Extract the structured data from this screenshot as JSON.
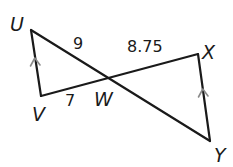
{
  "diagram": {
    "type": "geometry-intersecting-segments",
    "vertices": {
      "U": {
        "label": "U",
        "x": 31,
        "y": 30
      },
      "V": {
        "label": "V",
        "x": 41,
        "y": 96
      },
      "W": {
        "label": "W",
        "x": 112,
        "y": 79
      },
      "X": {
        "label": "X",
        "x": 198,
        "y": 54
      },
      "Y": {
        "label": "Y",
        "x": 210,
        "y": 141
      }
    },
    "segments": [
      {
        "from": "U",
        "to": "Y",
        "name": "UY"
      },
      {
        "from": "V",
        "to": "X",
        "name": "VX"
      },
      {
        "from": "U",
        "to": "V",
        "name": "UV",
        "parallel_mark": true
      },
      {
        "from": "X",
        "to": "Y",
        "name": "XY",
        "parallel_mark": true
      }
    ],
    "measurements": {
      "UW": "9",
      "WX": "8.75",
      "VW": "7"
    },
    "colors": {
      "line": "#1a1a1a",
      "parallel_mark": "#8a8a8a",
      "background": "#ffffff"
    }
  }
}
